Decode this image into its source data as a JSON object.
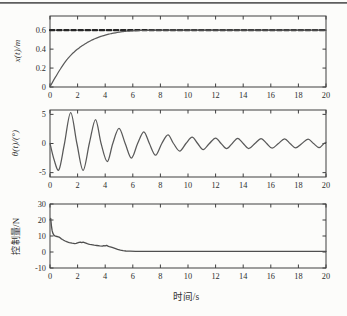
{
  "figure": {
    "time_axis_label": "时间/s"
  },
  "chart_data": [
    {
      "type": "line",
      "ylabel": "x(t)/m",
      "xlabel": "",
      "xlim": [
        0,
        20
      ],
      "ylim": [
        0,
        0.75
      ],
      "xticks": [
        0,
        2,
        4,
        6,
        8,
        10,
        12,
        14,
        16,
        18,
        20
      ],
      "yticks": [
        0,
        0.2,
        0.4,
        0.6
      ],
      "grid": false,
      "legend": "none",
      "series": [
        {
          "name": "position-reference",
          "style": "dashed",
          "smooth": false,
          "color": "#262626",
          "width": 2.2,
          "points": [
            [
              0,
              0.6
            ],
            [
              20,
              0.6
            ]
          ]
        },
        {
          "name": "cart-position-response",
          "style": "solid",
          "smooth": true,
          "color": "#595959",
          "width": 1.2,
          "points": [
            [
              0,
              0
            ],
            [
              0.25,
              0.07
            ],
            [
              0.5,
              0.13
            ],
            [
              0.75,
              0.19
            ],
            [
              1,
              0.245
            ],
            [
              1.25,
              0.295
            ],
            [
              1.5,
              0.335
            ],
            [
              1.75,
              0.37
            ],
            [
              2,
              0.4
            ],
            [
              2.25,
              0.428
            ],
            [
              2.5,
              0.452
            ],
            [
              2.75,
              0.474
            ],
            [
              3,
              0.493
            ],
            [
              3.25,
              0.51
            ],
            [
              3.5,
              0.524
            ],
            [
              3.75,
              0.537
            ],
            [
              4,
              0.548
            ],
            [
              4.25,
              0.558
            ],
            [
              4.5,
              0.566
            ],
            [
              4.75,
              0.573
            ],
            [
              5,
              0.579
            ],
            [
              5.25,
              0.584
            ],
            [
              5.5,
              0.588
            ],
            [
              5.75,
              0.591
            ],
            [
              6,
              0.594
            ],
            [
              6.5,
              0.597
            ],
            [
              7,
              0.599
            ],
            [
              7.5,
              0.6
            ],
            [
              8,
              0.6
            ],
            [
              9,
              0.6
            ],
            [
              10,
              0.6
            ],
            [
              12,
              0.6
            ],
            [
              14,
              0.6
            ],
            [
              16,
              0.6
            ],
            [
              18,
              0.6
            ],
            [
              20,
              0.6
            ]
          ]
        }
      ]
    },
    {
      "type": "line",
      "ylabel": "θ(t)/(°)",
      "xlabel": "",
      "xlim": [
        0,
        20
      ],
      "ylim": [
        -5.75,
        5.75
      ],
      "xticks": [
        0,
        2,
        4,
        6,
        8,
        10,
        12,
        14,
        16,
        18,
        20
      ],
      "yticks": [
        -5,
        0,
        5
      ],
      "grid": false,
      "legend": "none",
      "series": [
        {
          "name": "pendulum-angle-response",
          "style": "solid",
          "smooth": true,
          "color": "#595959",
          "width": 1.25,
          "points": [
            [
              0,
              0
            ],
            [
              0.3,
              -2.8
            ],
            [
              0.65,
              -4.5
            ],
            [
              1.05,
              0
            ],
            [
              1.5,
              5.3
            ],
            [
              1.95,
              0
            ],
            [
              2.4,
              -4.6
            ],
            [
              2.85,
              0
            ],
            [
              3.3,
              4.1
            ],
            [
              3.7,
              0
            ],
            [
              4.15,
              -3.1
            ],
            [
              4.55,
              0
            ],
            [
              5.0,
              2.6
            ],
            [
              5.45,
              0
            ],
            [
              5.9,
              -2.5
            ],
            [
              6.35,
              0
            ],
            [
              6.8,
              2.0
            ],
            [
              7.2,
              0
            ],
            [
              7.65,
              -2.0
            ],
            [
              8.1,
              0
            ],
            [
              8.55,
              1.5
            ],
            [
              8.95,
              0
            ],
            [
              9.4,
              -1.3
            ],
            [
              9.85,
              0
            ],
            [
              10.3,
              1.1
            ],
            [
              10.7,
              0
            ],
            [
              11.1,
              -1.05
            ],
            [
              11.55,
              0
            ],
            [
              12.0,
              0.95
            ],
            [
              12.4,
              0
            ],
            [
              12.8,
              -0.9
            ],
            [
              13.2,
              0
            ],
            [
              13.6,
              0.9
            ],
            [
              14.0,
              0
            ],
            [
              14.4,
              -0.85
            ],
            [
              14.85,
              0
            ],
            [
              15.3,
              0.85
            ],
            [
              15.7,
              0
            ],
            [
              16.1,
              -0.8
            ],
            [
              16.55,
              0
            ],
            [
              17.0,
              0.8
            ],
            [
              17.4,
              0
            ],
            [
              17.8,
              -0.75
            ],
            [
              18.25,
              0
            ],
            [
              18.7,
              0.75
            ],
            [
              19.1,
              0
            ],
            [
              19.5,
              -0.7
            ],
            [
              19.85,
              0
            ],
            [
              20,
              0.2
            ]
          ]
        }
      ]
    },
    {
      "type": "line",
      "ylabel": "控制量/N",
      "xlabel": "时间/s",
      "xlim": [
        0,
        20
      ],
      "ylim": [
        -10,
        30
      ],
      "xticks": [
        0,
        2,
        4,
        6,
        8,
        10,
        12,
        14,
        16,
        18,
        20
      ],
      "yticks": [
        -10,
        0,
        10,
        20,
        30
      ],
      "grid": false,
      "legend": "none",
      "series": [
        {
          "name": "control-force",
          "style": "solid",
          "smooth": false,
          "color": "#4f4f4f",
          "width": 1.3,
          "points": [
            [
              0,
              20
            ],
            [
              0.05,
              21
            ],
            [
              0.1,
              16.5
            ],
            [
              0.15,
              13.5
            ],
            [
              0.2,
              11.8
            ],
            [
              0.3,
              10.4
            ],
            [
              0.4,
              9.9
            ],
            [
              0.5,
              9.7
            ],
            [
              0.6,
              9.5
            ],
            [
              0.7,
              9.1
            ],
            [
              0.8,
              8.4
            ],
            [
              0.9,
              7.8
            ],
            [
              1.0,
              7.3
            ],
            [
              1.1,
              6.9
            ],
            [
              1.2,
              6.5
            ],
            [
              1.3,
              6.2
            ],
            [
              1.4,
              5.9
            ],
            [
              1.5,
              5.7
            ],
            [
              1.6,
              5.5
            ],
            [
              1.7,
              5.35
            ],
            [
              1.8,
              5.25
            ],
            [
              1.9,
              5.4
            ],
            [
              2.0,
              5.7
            ],
            [
              2.1,
              6.0
            ],
            [
              2.2,
              6.15
            ],
            [
              2.3,
              5.8
            ],
            [
              2.4,
              6.1
            ],
            [
              2.5,
              5.8
            ],
            [
              2.6,
              5.5
            ],
            [
              2.7,
              5.2
            ],
            [
              2.8,
              4.95
            ],
            [
              2.9,
              4.75
            ],
            [
              3.0,
              4.6
            ],
            [
              3.2,
              4.3
            ],
            [
              3.4,
              4.05
            ],
            [
              3.6,
              3.8
            ],
            [
              3.8,
              3.6
            ],
            [
              3.9,
              4.0
            ],
            [
              4.0,
              3.8
            ],
            [
              4.1,
              4.15
            ],
            [
              4.2,
              3.7
            ],
            [
              4.3,
              3.4
            ],
            [
              4.5,
              2.9
            ],
            [
              4.7,
              2.3
            ],
            [
              4.9,
              1.7
            ],
            [
              5.1,
              1.2
            ],
            [
              5.3,
              0.85
            ],
            [
              5.5,
              0.65
            ],
            [
              5.8,
              0.55
            ],
            [
              6.2,
              0.45
            ],
            [
              7,
              0.45
            ],
            [
              8,
              0.4
            ],
            [
              9,
              0.45
            ],
            [
              10,
              0.4
            ],
            [
              12,
              0.4
            ],
            [
              14,
              0.4
            ],
            [
              16,
              0.4
            ],
            [
              18,
              0.4
            ],
            [
              20,
              0.4
            ]
          ]
        }
      ]
    }
  ]
}
